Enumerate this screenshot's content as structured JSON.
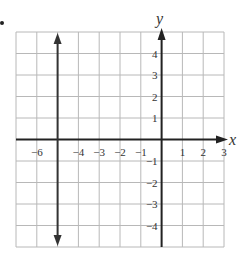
{
  "chart_data": {
    "type": "line",
    "title": "",
    "xlabel": "x",
    "ylabel": "y",
    "xlim": [
      -7,
      3
    ],
    "ylim": [
      -5,
      5
    ],
    "grid": true,
    "x_tick_labels": [
      "-6",
      "-4",
      "-3",
      "-2",
      "-1",
      "1",
      "2",
      "3"
    ],
    "x_tick_values": [
      -6,
      -4,
      -3,
      -2,
      -1,
      1,
      2,
      3
    ],
    "y_tick_labels": [
      "4",
      "3",
      "2",
      "1",
      "-1",
      "-2",
      "-3",
      "-4"
    ],
    "y_tick_values": [
      4,
      3,
      2,
      1,
      -1,
      -2,
      -3,
      -4
    ],
    "series": [
      {
        "name": "x = -5",
        "description": "vertical line with arrows at both ends",
        "x": [
          -5,
          -5
        ],
        "y": [
          -5,
          5
        ]
      }
    ]
  },
  "labels": {
    "x_axis": "x",
    "y_axis": "y"
  },
  "colors": {
    "grid": "#b8b8b8",
    "axis": "#222222",
    "line": "#333333",
    "text": "#333333"
  }
}
